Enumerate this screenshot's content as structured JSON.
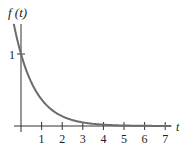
{
  "chart_data": {
    "type": "line",
    "title": "",
    "function": "f(t) = e^(-t)",
    "xlabel": "t",
    "ylabel": "f(t)",
    "x_ticks": [
      "1",
      "2",
      "3",
      "4",
      "5",
      "6",
      "7"
    ],
    "y_ticks": [
      "1"
    ],
    "xlim": [
      -0.35,
      7.3
    ],
    "ylim": [
      0,
      1.45
    ],
    "grid": false,
    "legend": null,
    "series": [
      {
        "name": "f(t)",
        "x": [
          -0.35,
          0,
          0.5,
          1,
          1.5,
          2,
          2.5,
          3,
          3.5,
          4,
          5,
          6,
          7
        ],
        "values": [
          1.42,
          1.0,
          0.61,
          0.37,
          0.22,
          0.14,
          0.08,
          0.05,
          0.03,
          0.02,
          0.01,
          0.0,
          0.0
        ],
        "color": "#6b6b6b"
      }
    ]
  },
  "labels": {
    "y_axis": "f (t)",
    "x_axis": "t",
    "y_tick_1": "1",
    "x_ticks": [
      "1",
      "2",
      "3",
      "4",
      "5",
      "6",
      "7"
    ]
  }
}
